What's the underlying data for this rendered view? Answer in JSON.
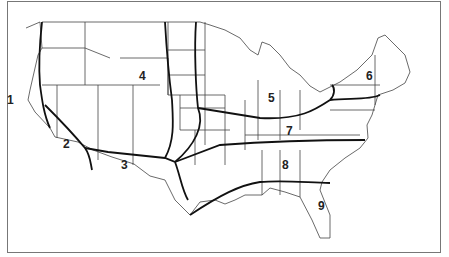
{
  "map": {
    "title": "Continental United States zone map",
    "zones": [
      {
        "id": "1",
        "label": "1",
        "x": 7,
        "y": 95
      },
      {
        "id": "2",
        "label": "2",
        "x": 63,
        "y": 138
      },
      {
        "id": "3",
        "label": "3",
        "x": 123,
        "y": 159
      },
      {
        "id": "4",
        "label": "4",
        "x": 140,
        "y": 70
      },
      {
        "id": "5",
        "label": "5",
        "x": 268,
        "y": 92
      },
      {
        "id": "6",
        "label": "6",
        "x": 367,
        "y": 70
      },
      {
        "id": "7",
        "label": "7",
        "x": 285,
        "y": 125
      },
      {
        "id": "8",
        "label": "8",
        "x": 283,
        "y": 159
      },
      {
        "id": "9",
        "label": "9",
        "x": 319,
        "y": 200
      }
    ]
  }
}
